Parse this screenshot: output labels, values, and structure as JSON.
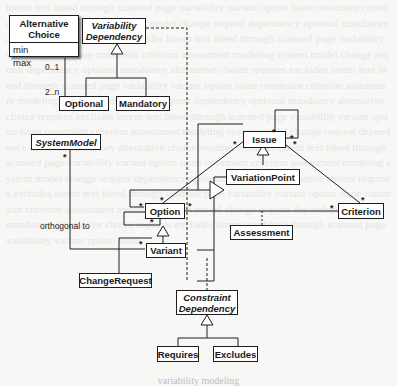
{
  "classes": {
    "alternative_choice": {
      "title": "Alternative Choice",
      "attributes": [
        "min",
        "max"
      ]
    },
    "variability_dependency": {
      "title": "Variability Dependency"
    },
    "optional": {
      "title": "Optional"
    },
    "mandatory": {
      "title": "Mandatory"
    },
    "system_model": {
      "title": "SystemModel"
    },
    "issue": {
      "title": "Issue"
    },
    "variation_point": {
      "title": "VariationPoint"
    },
    "option": {
      "title": "Option"
    },
    "criterion": {
      "title": "Criterion"
    },
    "assessment": {
      "title": "Assessment"
    },
    "variant": {
      "title": "Variant"
    },
    "change_request": {
      "title": "ChangeRequest"
    },
    "constraint_dependency": {
      "title": "Constraint Dependency"
    },
    "requires": {
      "title": "Requires"
    },
    "excludes": {
      "title": "Excludes"
    }
  },
  "labels": {
    "multiplicity_0_1": "0..1",
    "multiplicity_2_n": "2..n",
    "many": "*",
    "orthogonal_to": "orthogonal to"
  },
  "caption": "variability modeling",
  "colors": {
    "line": "#1e1e1e",
    "box_fill": "#ffffff",
    "background": "#f7f7f5"
  }
}
